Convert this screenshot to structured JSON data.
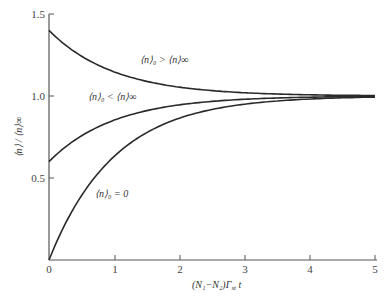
{
  "chart_data": {
    "type": "line",
    "title": "",
    "xlabel": "(N₁−N₂)Γst t",
    "ylabel": "⟨n⟩ / ⟨n⟩∞",
    "xlim": [
      0,
      5
    ],
    "ylim": [
      0,
      1.5
    ],
    "x_ticks": [
      "0",
      "1",
      "2",
      "3",
      "4",
      "5"
    ],
    "y_ticks": [
      "0.5",
      "1.0",
      "1.5"
    ],
    "grid": false,
    "legend": "inline labels",
    "series": [
      {
        "name": "⟨n⟩₀ > ⟨n⟩∞",
        "x": [
          0,
          0.5,
          1,
          1.5,
          2,
          2.5,
          3,
          3.5,
          4,
          4.5,
          5
        ],
        "values": [
          1.4,
          1.24,
          1.15,
          1.09,
          1.05,
          1.03,
          1.02,
          1.01,
          1.01,
          1.0,
          1.0
        ]
      },
      {
        "name": "⟨n⟩₀ < ⟨n⟩∞",
        "x": [
          0,
          0.5,
          1,
          1.5,
          2,
          2.5,
          3,
          3.5,
          4,
          4.5,
          5
        ],
        "values": [
          0.6,
          0.76,
          0.85,
          0.91,
          0.95,
          0.97,
          0.98,
          0.99,
          0.99,
          1.0,
          1.0
        ]
      },
      {
        "name": "⟨n⟩₀ = 0",
        "x": [
          0,
          0.5,
          1,
          1.5,
          2,
          2.5,
          3,
          3.5,
          4,
          4.5,
          5
        ],
        "values": [
          0.0,
          0.39,
          0.63,
          0.78,
          0.86,
          0.92,
          0.95,
          0.97,
          0.98,
          0.99,
          0.99
        ]
      }
    ],
    "annotations": [
      {
        "text": "⟨n⟩₀ > ⟨n⟩∞",
        "x": 1.4,
        "y": 1.27
      },
      {
        "text": "⟨n⟩₀ < ⟨n⟩∞",
        "x": 0.55,
        "y": 1.02
      },
      {
        "text": "⟨n⟩₀ = 0",
        "x": 0.65,
        "y": 0.38
      }
    ]
  },
  "labels": {
    "y_axis": "⟨n⟩ / ⟨n⟩∞",
    "x_axis_main": "(N₁−N₂)Γ",
    "x_axis_sub": "st",
    "x_axis_tail": " t",
    "curve_upper": "⟨n⟩₀ > ⟨n⟩∞",
    "curve_middle": "⟨n⟩₀ < ⟨n⟩∞",
    "curve_lower": "⟨n⟩₀ = 0"
  },
  "colors": {
    "curve": "#2a2a2a",
    "axis": "#555555"
  }
}
